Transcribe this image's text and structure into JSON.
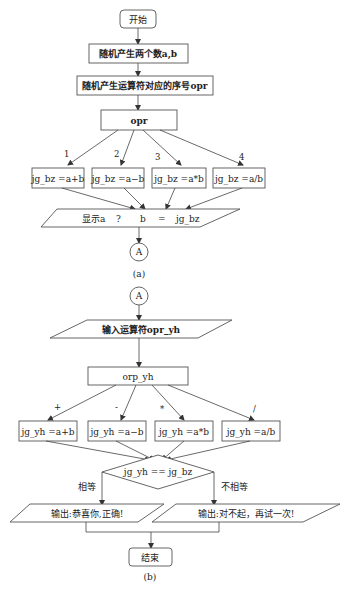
{
  "diagram_a": {
    "start": "开始",
    "step1": "随机产生两个数a,b",
    "step2": "随机产生运算符对应的序号opr",
    "switch": "opr",
    "branch_labels": [
      "1",
      "2",
      "3",
      "4"
    ],
    "branches": [
      "jg_bz =a+b",
      "jg_bz =a−b",
      "jg_bz =a*b",
      "jg_bz =a/b"
    ],
    "display": {
      "prefix": "显示a",
      "op": "?",
      "b": "b",
      "eq": "=",
      "result": "jg_bz"
    },
    "connector": "A",
    "caption": "(a)"
  },
  "diagram_b": {
    "connector": "A",
    "input": "输入运算符opr_yh",
    "switch": "orp_yh",
    "branch_labels": [
      "+",
      "-",
      "*",
      "/"
    ],
    "branches": [
      "jg_yh =a+b",
      "jg_yh =a−b",
      "jg_yh =a*b",
      "jg_yh =a/b"
    ],
    "decision": "jg_yh == jg_bz",
    "yes_label": "相等",
    "no_label": "不相等",
    "output_yes": "输出:恭喜你,正确!",
    "output_no": "输出:对不起，再试一次!",
    "end": "结束",
    "caption": "(b)"
  }
}
